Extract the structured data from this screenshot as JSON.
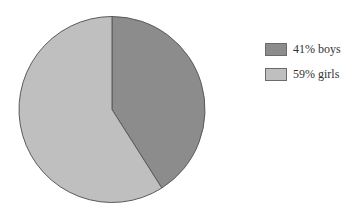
{
  "chart_data": {
    "type": "pie",
    "title": "",
    "categories": [
      "boys",
      "girls"
    ],
    "values": [
      41,
      59
    ],
    "unit": "%",
    "legend_position": "right",
    "start_angle_deg": 0,
    "direction": "clockwise-from-top",
    "colors": [
      "#8c8c8c",
      "#bfbfbf"
    ],
    "outline_color": "#5a5a5a"
  },
  "legend": {
    "items": [
      {
        "label": "41% boys",
        "color": "#8c8c8c"
      },
      {
        "label": "59% girls",
        "color": "#bfbfbf"
      }
    ]
  }
}
